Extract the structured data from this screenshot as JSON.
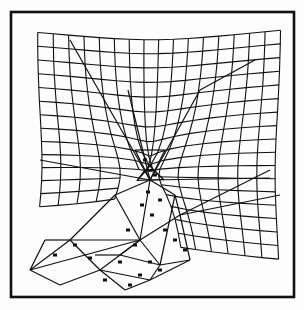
{
  "figure": {
    "width": 304,
    "height": 310,
    "background": "#fdfdfd",
    "frame": {
      "x": 11,
      "y": 12,
      "w": 283,
      "h": 285,
      "stroke": "#111111",
      "stroke_width": 2.6
    },
    "line_color": "#111111",
    "grid": {
      "cols": 16,
      "rows": 17,
      "top_left": [
        37,
        32
      ],
      "top_right": [
        281,
        30
      ],
      "bottom_right": [
        281,
        270
      ],
      "left_bottom": [
        30,
        230
      ]
    },
    "mesh_edges": [
      [
        [
          70,
          40
        ],
        [
          150,
          180
        ]
      ],
      [
        [
          128,
          90
        ],
        [
          150,
          180
        ]
      ],
      [
        [
          150,
          180
        ],
        [
          200,
          90
        ]
      ],
      [
        [
          200,
          90
        ],
        [
          255,
          60
        ]
      ],
      [
        [
          40,
          160
        ],
        [
          150,
          180
        ]
      ],
      [
        [
          150,
          180
        ],
        [
          270,
          178
        ]
      ],
      [
        [
          150,
          180
        ],
        [
          140,
          240
        ]
      ],
      [
        [
          140,
          240
        ],
        [
          180,
          215
        ]
      ],
      [
        [
          180,
          215
        ],
        [
          270,
          170
        ]
      ],
      [
        [
          180,
          215
        ],
        [
          280,
          195
        ]
      ],
      [
        [
          180,
          215
        ],
        [
          190,
          260
        ]
      ],
      [
        [
          190,
          260
        ],
        [
          150,
          280
        ]
      ],
      [
        [
          140,
          240
        ],
        [
          30,
          270
        ]
      ],
      [
        [
          30,
          270
        ],
        [
          70,
          240
        ]
      ],
      [
        [
          70,
          240
        ],
        [
          140,
          240
        ]
      ],
      [
        [
          70,
          240
        ],
        [
          100,
          270
        ]
      ],
      [
        [
          100,
          270
        ],
        [
          150,
          280
        ]
      ],
      [
        [
          100,
          270
        ],
        [
          140,
          240
        ]
      ],
      [
        [
          45,
          240
        ],
        [
          30,
          270
        ]
      ],
      [
        [
          45,
          240
        ],
        [
          70,
          240
        ]
      ],
      [
        [
          100,
          270
        ],
        [
          125,
          290
        ]
      ],
      [
        [
          125,
          290
        ],
        [
          150,
          280
        ]
      ],
      [
        [
          120,
          255
        ],
        [
          160,
          265
        ]
      ],
      [
        [
          160,
          265
        ],
        [
          190,
          260
        ]
      ],
      [
        [
          140,
          240
        ],
        [
          160,
          265
        ]
      ],
      [
        [
          160,
          265
        ],
        [
          150,
          280
        ]
      ],
      [
        [
          115,
          195
        ],
        [
          140,
          240
        ]
      ],
      [
        [
          115,
          195
        ],
        [
          150,
          180
        ]
      ],
      [
        [
          115,
          195
        ],
        [
          70,
          240
        ]
      ],
      [
        [
          175,
          195
        ],
        [
          180,
          215
        ]
      ],
      [
        [
          175,
          195
        ],
        [
          150,
          180
        ]
      ],
      [
        [
          175,
          195
        ],
        [
          160,
          265
        ]
      ],
      [
        [
          95,
          255
        ],
        [
          120,
          255
        ]
      ],
      [
        [
          120,
          255
        ],
        [
          140,
          240
        ]
      ],
      [
        [
          60,
          285
        ],
        [
          100,
          270
        ]
      ],
      [
        [
          60,
          285
        ],
        [
          30,
          270
        ]
      ],
      [
        [
          165,
          150
        ],
        [
          150,
          180
        ]
      ],
      [
        [
          135,
          150
        ],
        [
          150,
          180
        ]
      ],
      [
        [
          135,
          150
        ],
        [
          165,
          150
        ]
      ]
    ],
    "markers": [
      [
        145,
        160
      ],
      [
        155,
        175
      ],
      [
        148,
        192
      ],
      [
        160,
        200
      ],
      [
        142,
        205
      ],
      [
        152,
        215
      ],
      [
        128,
        230
      ],
      [
        135,
        245
      ],
      [
        165,
        230
      ],
      [
        120,
        262
      ],
      [
        150,
        262
      ],
      [
        160,
        270
      ],
      [
        105,
        280
      ],
      [
        90,
        258
      ],
      [
        75,
        245
      ],
      [
        55,
        255
      ],
      [
        175,
        240
      ],
      [
        185,
        250
      ],
      [
        140,
        275
      ],
      [
        130,
        285
      ]
    ]
  }
}
